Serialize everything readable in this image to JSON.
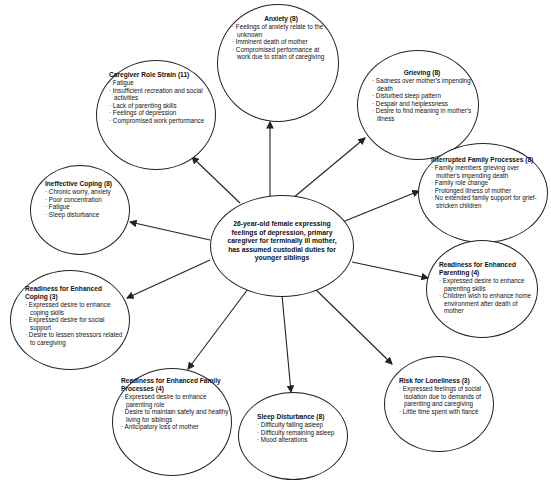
{
  "diagram": {
    "type": "concept-map",
    "center": {
      "text": "26-year-old female expressing feelings of depression, primary caregiver for terminally ill mother, has assumed custodial duties for younger siblings"
    },
    "nodes": [
      {
        "id": "anxiety",
        "title": "Anxiety (8)",
        "items": [
          "Feelings of anxiety relate to the unknown",
          "Imminent death of mother",
          "Compromised performance at work due to strain of caregiving"
        ]
      },
      {
        "id": "caregiver-role-strain",
        "title": "Caregiver Role Strain (11)",
        "items": [
          "Fatigue",
          "Insufficient recreation and social activities",
          "Lack of parenting skills",
          "Feelings of depression",
          "Compromised work performance"
        ]
      },
      {
        "id": "grieving",
        "title": "Grieving (8)",
        "items": [
          "Sadness over mother's impending death",
          "Disturbed sleep pattern",
          "Despair and helplessness",
          "Desire to find meaning in mother's illness"
        ]
      },
      {
        "id": "interrupted-family-processes",
        "title": "Interrupted Family Processes (8)",
        "items": [
          "Family members grieving over mother's impending death",
          "Family role change",
          "Prolonged illness of mother",
          "No extended family support for grief-stricken children"
        ]
      },
      {
        "id": "ineffective-coping",
        "title": "Ineffective Coping (8)",
        "items": [
          "Chronic worry, anxiety",
          "Poor concentration",
          "Fatigue",
          "Sleep disturbance"
        ]
      },
      {
        "id": "readiness-enhanced-parenting",
        "title": "Readiness for Enhanced Parenting (4)",
        "items": [
          "Expressed desire to enhance parenting skills",
          "Children wish to enhance home environment after death of mother"
        ]
      },
      {
        "id": "readiness-enhanced-coping",
        "title": "Readiness for Enhanced Coping (3)",
        "items": [
          "Expressed desire to enhance coping skills",
          "Expressed desire for social support",
          "Desire to lessen stressors related to caregiving"
        ]
      },
      {
        "id": "readiness-enhanced-family-processes",
        "title": "Readiness for Enhanced Family Processes (4)",
        "items": [
          "Expressed desire to enhance parenting role",
          "Desire to maintain safety and healthy living for siblings",
          "Anticipatory loss of mother"
        ]
      },
      {
        "id": "sleep-disturbance",
        "title": "Sleep Disturbance (8)",
        "items": [
          "Difficulty falling asleep",
          "Difficulty remaining asleep",
          "Mood alterations"
        ]
      },
      {
        "id": "risk-for-loneliness",
        "title": "Risk for Loneliness (3)",
        "items": [
          "Expressed feelings of social isolation due to demands of parenting and caregiving",
          "Little time spent with fiancé"
        ]
      }
    ],
    "colors": {
      "stroke": "#222222",
      "background": "#ffffff",
      "text": "#111111"
    }
  }
}
